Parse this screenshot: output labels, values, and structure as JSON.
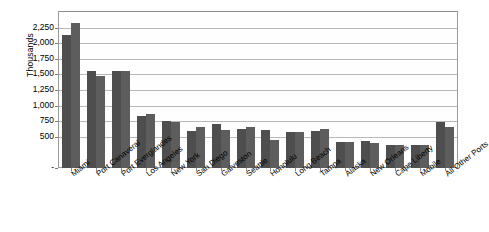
{
  "chart_data": {
    "type": "bar",
    "title": "",
    "subtitle": "",
    "xlabel": "",
    "ylabel": "Thousands",
    "ylim": [
      0,
      2500
    ],
    "ytick_values": [
      0,
      500,
      750,
      1000,
      1250,
      1500,
      1750,
      2000,
      2250
    ],
    "ytick_labels": [
      "-",
      "500",
      "750",
      "1,000",
      "1,250",
      "1,500",
      "1,750",
      "2,000",
      "2,250"
    ],
    "y_axis_interval": 250,
    "grid": true,
    "grid_axis": "y",
    "legend": "none",
    "legend_position": "none",
    "orientation": "vertical",
    "grouped": true,
    "categories": [
      "Miami",
      "Port Canaveral",
      "Port Everglandes",
      "Los Angeles",
      "New York",
      "San Diego",
      "Galveston",
      "Seattle",
      "Honolulu",
      "Long Beach",
      "Tampa",
      "Alaska",
      "New Orleans",
      "Cape Liberty",
      "Mobile",
      "All Other Ports"
    ],
    "series": [
      {
        "name": "Series 1",
        "color": "#4e4e4e",
        "values": [
          2125,
          1550,
          1550,
          840,
          760,
          595,
          710,
          625,
          610,
          585,
          600,
          415,
          440,
          370,
          365,
          730
        ]
      },
      {
        "name": "Series 2",
        "color": "#5d5d5d",
        "values": [
          2330,
          1470,
          1550,
          860,
          745,
          660,
          615,
          650,
          450,
          585,
          630,
          415,
          395,
          370,
          375,
          660
        ]
      }
    ],
    "annotations": []
  },
  "axis": {
    "y_title": "Thousands"
  },
  "colors": {
    "series1": "#4e4e4e",
    "series2": "#5d5d5d",
    "gridline": "#b8b8b8",
    "frame": "#9a9a9a",
    "background": "#ffffff",
    "text": "#000000"
  }
}
